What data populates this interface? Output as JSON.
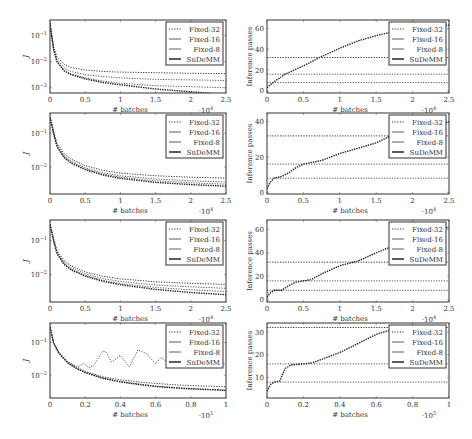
{
  "figure": {
    "legend_labels": [
      "Fixed-32",
      "Fixed-16",
      "Fixed-8",
      "SuDeMM"
    ],
    "colors": {
      "frame": "#333333",
      "series": "#444444",
      "text": "#333333"
    }
  },
  "chart_data": [
    {
      "id": "row1-left",
      "type": "line",
      "yscale": "log",
      "xlabel": "# batches",
      "ylabel": "J",
      "x_multiplier": "·10^4",
      "xlim": [
        0,
        2.5
      ],
      "ylim_log": [
        -3.2,
        -0.4
      ],
      "xticks": [
        0,
        0.5,
        1,
        1.5,
        2,
        2.5
      ],
      "xtick_labels": [
        "0",
        "0.5",
        "1",
        "1.5",
        "2",
        "2.5"
      ],
      "yticks_log": [
        -1,
        -2,
        -3
      ],
      "ytick_labels": [
        "10^-1",
        "10^-2",
        "10^-3"
      ],
      "legend": [
        "Fixed-32",
        "Fixed-16",
        "Fixed-8",
        "SuDeMM"
      ],
      "series": [
        {
          "name": "Fixed-32",
          "x": [
            0,
            0.05,
            0.1,
            0.2,
            0.3,
            0.5,
            0.75,
            1,
            1.5,
            2,
            2.5
          ],
          "y": [
            0.3,
            0.04,
            0.015,
            0.008,
            0.006,
            0.0048,
            0.0042,
            0.004,
            0.0038,
            0.0036,
            0.0035
          ]
        },
        {
          "name": "Fixed-16",
          "x": [
            0,
            0.05,
            0.1,
            0.2,
            0.3,
            0.5,
            0.75,
            1,
            1.5,
            2,
            2.5
          ],
          "y": [
            0.3,
            0.035,
            0.012,
            0.006,
            0.0042,
            0.0032,
            0.0027,
            0.0024,
            0.0021,
            0.002,
            0.0019
          ]
        },
        {
          "name": "Fixed-8",
          "x": [
            0,
            0.05,
            0.1,
            0.2,
            0.3,
            0.5,
            0.75,
            1,
            1.5,
            2,
            2.5
          ],
          "y": [
            0.3,
            0.03,
            0.01,
            0.0048,
            0.0034,
            0.0024,
            0.0018,
            0.0015,
            0.0012,
            0.0011,
            0.001
          ]
        },
        {
          "name": "SuDeMM",
          "x": [
            0,
            0.05,
            0.1,
            0.2,
            0.3,
            0.5,
            0.75,
            1,
            1.5,
            2,
            2.5
          ],
          "y": [
            0.3,
            0.03,
            0.01,
            0.0045,
            0.0032,
            0.0022,
            0.0016,
            0.0013,
            0.0009,
            0.0007,
            0.00055
          ]
        }
      ]
    },
    {
      "id": "row1-right",
      "type": "line",
      "yscale": "linear",
      "xlabel": "# batches",
      "ylabel": "Inference passes",
      "x_multiplier": "·10^4",
      "xlim": [
        0,
        2.5
      ],
      "ylim": [
        -2,
        68
      ],
      "xticks": [
        0,
        0.5,
        1,
        1.5,
        2,
        2.5
      ],
      "xtick_labels": [
        "0",
        "0.5",
        "1",
        "1.5",
        "2",
        "2.5"
      ],
      "yticks": [
        0,
        20,
        40,
        60
      ],
      "ytick_labels": [
        "0",
        "20",
        "40",
        "60"
      ],
      "legend": [
        "Fixed-32",
        "Fixed-16",
        "Fixed-8",
        "SuDeMM"
      ],
      "series": [
        {
          "name": "Fixed-32",
          "x": [
            0,
            2.5
          ],
          "y": [
            32,
            32
          ]
        },
        {
          "name": "Fixed-16",
          "x": [
            0,
            2.5
          ],
          "y": [
            16,
            16
          ]
        },
        {
          "name": "Fixed-8",
          "x": [
            0,
            2.5
          ],
          "y": [
            8,
            8
          ]
        },
        {
          "name": "SuDeMM",
          "x": [
            0,
            0.1,
            0.25,
            0.5,
            0.75,
            1,
            1.25,
            1.5,
            1.75,
            2.0,
            2.5
          ],
          "y": [
            3,
            9,
            16,
            24,
            33,
            41,
            48,
            53,
            57,
            60,
            63
          ]
        }
      ]
    },
    {
      "id": "row2-left",
      "type": "line",
      "yscale": "log",
      "xlabel": "# batches",
      "ylabel": "J",
      "x_multiplier": "·10^4",
      "xlim": [
        0,
        2.5
      ],
      "ylim_log": [
        -2.8,
        -0.4
      ],
      "xticks": [
        0,
        0.5,
        1,
        1.5,
        2,
        2.5
      ],
      "xtick_labels": [
        "0",
        "0.5",
        "1",
        "1.5",
        "2",
        "2.5"
      ],
      "yticks_log": [
        -1,
        -2
      ],
      "ytick_labels": [
        "10^-1",
        "10^-2"
      ],
      "legend": [
        "Fixed-32",
        "Fixed-16",
        "Fixed-8",
        "SuDeMM"
      ],
      "series": [
        {
          "name": "Fixed-32",
          "x": [
            0,
            0.05,
            0.1,
            0.2,
            0.3,
            0.5,
            0.75,
            1,
            1.5,
            2,
            2.5
          ],
          "y": [
            0.3,
            0.12,
            0.05,
            0.025,
            0.017,
            0.011,
            0.008,
            0.0066,
            0.0055,
            0.005,
            0.0047
          ]
        },
        {
          "name": "Fixed-16",
          "x": [
            0,
            0.05,
            0.1,
            0.2,
            0.3,
            0.5,
            0.75,
            1,
            1.5,
            2,
            2.5
          ],
          "y": [
            0.3,
            0.11,
            0.045,
            0.022,
            0.015,
            0.0095,
            0.0068,
            0.0055,
            0.0044,
            0.0039,
            0.0036
          ]
        },
        {
          "name": "Fixed-8",
          "x": [
            0,
            0.05,
            0.1,
            0.2,
            0.3,
            0.5,
            0.75,
            1,
            1.5,
            2,
            2.5
          ],
          "y": [
            0.3,
            0.1,
            0.042,
            0.02,
            0.014,
            0.0088,
            0.0062,
            0.005,
            0.0039,
            0.0034,
            0.0031
          ]
        },
        {
          "name": "SuDeMM",
          "x": [
            0,
            0.05,
            0.1,
            0.2,
            0.3,
            0.5,
            0.75,
            1,
            1.5,
            2,
            2.5
          ],
          "y": [
            0.3,
            0.1,
            0.04,
            0.019,
            0.013,
            0.0083,
            0.0058,
            0.0046,
            0.0035,
            0.003,
            0.0027
          ]
        }
      ]
    },
    {
      "id": "row2-right",
      "type": "line",
      "yscale": "linear",
      "xlabel": "# batches",
      "ylabel": "Inference passes",
      "x_multiplier": "·10^4",
      "xlim": [
        0,
        2.5
      ],
      "ylim": [
        -1,
        45
      ],
      "xticks": [
        0,
        0.5,
        1,
        1.5,
        2,
        2.5
      ],
      "xtick_labels": [
        "0",
        "0.5",
        "1",
        "1.5",
        "2",
        "2.5"
      ],
      "yticks": [
        0,
        20,
        40
      ],
      "ytick_labels": [
        "0",
        "20",
        "40"
      ],
      "legend": [
        "Fixed-32",
        "Fixed-16",
        "Fixed-8",
        "SuDeMM"
      ],
      "series": [
        {
          "name": "Fixed-32",
          "x": [
            0,
            2.5
          ],
          "y": [
            32,
            32
          ]
        },
        {
          "name": "Fixed-16",
          "x": [
            0,
            2.5
          ],
          "y": [
            16,
            16
          ]
        },
        {
          "name": "Fixed-8",
          "x": [
            0,
            2.5
          ],
          "y": [
            8,
            8
          ]
        },
        {
          "name": "SuDeMM",
          "x": [
            0,
            0.05,
            0.1,
            0.2,
            0.3,
            0.4,
            0.5,
            0.75,
            1,
            1.25,
            1.5,
            1.7,
            2.0,
            2.3,
            2.5
          ],
          "y": [
            2,
            6,
            8,
            9,
            11,
            14,
            16,
            18,
            22,
            25,
            28,
            32,
            35,
            38,
            40
          ]
        }
      ]
    },
    {
      "id": "row3-left",
      "type": "line",
      "yscale": "log",
      "xlabel": "# batches",
      "ylabel": "J",
      "x_multiplier": "·10^4",
      "xlim": [
        0,
        2.5
      ],
      "ylim_log": [
        -2.8,
        -0.4
      ],
      "xticks": [
        0,
        0.5,
        1,
        1.5,
        2,
        2.5
      ],
      "xtick_labels": [
        "0",
        "0.5",
        "1",
        "1.5",
        "2",
        "2.5"
      ],
      "yticks_log": [
        -1,
        -2
      ],
      "ytick_labels": [
        "10^-1",
        "10^-2"
      ],
      "legend": [
        "Fixed-32",
        "Fixed-16",
        "Fixed-8",
        "SuDeMM"
      ],
      "series": [
        {
          "name": "Fixed-32",
          "x": [
            0,
            0.05,
            0.1,
            0.2,
            0.3,
            0.5,
            0.75,
            1,
            1.5,
            2,
            2.5
          ],
          "y": [
            0.3,
            0.12,
            0.05,
            0.026,
            0.018,
            0.012,
            0.009,
            0.0075,
            0.0062,
            0.0056,
            0.0052
          ]
        },
        {
          "name": "Fixed-16",
          "x": [
            0,
            0.05,
            0.1,
            0.2,
            0.3,
            0.5,
            0.75,
            1,
            1.5,
            2,
            2.5
          ],
          "y": [
            0.3,
            0.11,
            0.046,
            0.023,
            0.016,
            0.0105,
            0.0077,
            0.0063,
            0.005,
            0.0044,
            0.004
          ]
        },
        {
          "name": "Fixed-8",
          "x": [
            0,
            0.05,
            0.1,
            0.2,
            0.3,
            0.5,
            0.75,
            1,
            1.5,
            2,
            2.5
          ],
          "y": [
            0.3,
            0.1,
            0.043,
            0.021,
            0.0145,
            0.0095,
            0.0068,
            0.0055,
            0.0042,
            0.0036,
            0.0032
          ]
        },
        {
          "name": "SuDeMM",
          "x": [
            0,
            0.05,
            0.1,
            0.2,
            0.3,
            0.5,
            0.75,
            1,
            1.5,
            2,
            2.5
          ],
          "y": [
            0.3,
            0.1,
            0.041,
            0.02,
            0.0138,
            0.009,
            0.0064,
            0.0051,
            0.0037,
            0.003,
            0.0026
          ]
        }
      ]
    },
    {
      "id": "row3-right",
      "type": "line",
      "yscale": "linear",
      "xlabel": "# batches",
      "ylabel": "Inference passes",
      "x_multiplier": "·10^4",
      "xlim": [
        0,
        2.5
      ],
      "ylim": [
        -2,
        68
      ],
      "xticks": [
        0,
        0.5,
        1,
        1.5,
        2,
        2.5
      ],
      "xtick_labels": [
        "0",
        "0.5",
        "1",
        "1.5",
        "2",
        "2.5"
      ],
      "yticks": [
        0,
        20,
        40,
        60
      ],
      "ytick_labels": [
        "0",
        "20",
        "40",
        "60"
      ],
      "legend": [
        "Fixed-32",
        "Fixed-16",
        "Fixed-8",
        "SuDeMM"
      ],
      "series": [
        {
          "name": "Fixed-32",
          "x": [
            0,
            2.5
          ],
          "y": [
            32,
            32
          ]
        },
        {
          "name": "Fixed-16",
          "x": [
            0,
            2.5
          ],
          "y": [
            16,
            16
          ]
        },
        {
          "name": "Fixed-8",
          "x": [
            0,
            2.5
          ],
          "y": [
            8,
            8
          ]
        },
        {
          "name": "SuDeMM",
          "x": [
            0,
            0.05,
            0.1,
            0.2,
            0.3,
            0.4,
            0.6,
            0.75,
            1,
            1.25,
            1.5,
            1.7,
            2.0,
            2.3,
            2.5
          ],
          "y": [
            2,
            6,
            8,
            8,
            12,
            15,
            17,
            22,
            29,
            33,
            40,
            45,
            52,
            58,
            62
          ]
        }
      ]
    },
    {
      "id": "row4-left",
      "type": "line",
      "yscale": "log",
      "xlabel": "# batches",
      "ylabel": "J",
      "x_multiplier": "·10^5",
      "xlim": [
        0,
        1
      ],
      "ylim_log": [
        -2.7,
        -0.4
      ],
      "xticks": [
        0,
        0.2,
        0.4,
        0.6,
        0.8,
        1
      ],
      "xtick_labels": [
        "0",
        "0.2",
        "0.4",
        "0.6",
        "0.8",
        "1"
      ],
      "yticks_log": [
        -1,
        -2
      ],
      "ytick_labels": [
        "10^-1",
        "10^-2"
      ],
      "legend": [
        "Fixed-32",
        "Fixed-16",
        "Fixed-8",
        "SuDeMM"
      ],
      "series": [
        {
          "name": "Fixed-32",
          "x": [
            0,
            0.02,
            0.05,
            0.1,
            0.15,
            0.2,
            0.3,
            0.4,
            0.5,
            0.6,
            0.7,
            0.8,
            0.9,
            1
          ],
          "y": [
            0.3,
            0.1,
            0.05,
            0.026,
            0.018,
            0.013,
            0.009,
            0.0072,
            0.0062,
            0.0056,
            0.0051,
            0.0048,
            0.0046,
            0.0044
          ]
        },
        {
          "name": "Fixed-16",
          "x": [
            0,
            0.02,
            0.05,
            0.1,
            0.15,
            0.17,
            0.19,
            0.22,
            0.25,
            0.3,
            0.32,
            0.35,
            0.4,
            0.45,
            0.5,
            0.55,
            0.6,
            0.63,
            0.66,
            0.7,
            0.75,
            0.8,
            0.85,
            0.9,
            1
          ],
          "y": [
            0.3,
            0.1,
            0.05,
            0.026,
            0.018,
            0.019,
            0.023,
            0.017,
            0.02,
            0.055,
            0.05,
            0.025,
            0.04,
            0.018,
            0.06,
            0.045,
            0.022,
            0.035,
            0.026,
            0.045,
            0.022,
            0.03,
            0.024,
            0.025,
            0.022
          ]
        },
        {
          "name": "Fixed-8",
          "x": [
            0,
            0.02,
            0.05,
            0.1,
            0.15,
            0.2,
            0.3,
            0.4,
            0.5,
            0.6,
            0.7,
            0.8,
            0.9,
            1
          ],
          "y": [
            0.3,
            0.1,
            0.048,
            0.024,
            0.016,
            0.012,
            0.0082,
            0.0064,
            0.0054,
            0.0047,
            0.0042,
            0.0039,
            0.0037,
            0.0035
          ]
        },
        {
          "name": "SuDeMM",
          "x": [
            0,
            0.02,
            0.05,
            0.1,
            0.15,
            0.2,
            0.3,
            0.4,
            0.5,
            0.6,
            0.7,
            0.8,
            0.9,
            1
          ],
          "y": [
            0.3,
            0.1,
            0.048,
            0.024,
            0.016,
            0.012,
            0.008,
            0.0062,
            0.0052,
            0.0045,
            0.0041,
            0.0038,
            0.0036,
            0.0034
          ]
        }
      ]
    },
    {
      "id": "row4-right",
      "type": "line",
      "yscale": "linear",
      "xlabel": "# batches",
      "ylabel": "Inference passes",
      "x_multiplier": "·10^5",
      "xlim": [
        0,
        1
      ],
      "ylim": [
        1,
        34
      ],
      "xticks": [
        0,
        0.2,
        0.4,
        0.6,
        0.8,
        1
      ],
      "xtick_labels": [
        "0",
        "0.2",
        "0.4",
        "0.6",
        "0.8",
        "1"
      ],
      "yticks": [
        10,
        20,
        30
      ],
      "ytick_labels": [
        "10",
        "20",
        "30"
      ],
      "legend": [
        "Fixed-32",
        "Fixed-16",
        "Fixed-8",
        "SuDeMM"
      ],
      "series": [
        {
          "name": "Fixed-32",
          "x": [
            0,
            1
          ],
          "y": [
            32,
            32
          ]
        },
        {
          "name": "Fixed-16",
          "x": [
            0,
            1
          ],
          "y": [
            16,
            16
          ]
        },
        {
          "name": "Fixed-8",
          "x": [
            0,
            1
          ],
          "y": [
            8,
            8
          ]
        },
        {
          "name": "SuDeMM",
          "x": [
            0,
            0.02,
            0.04,
            0.07,
            0.1,
            0.13,
            0.2,
            0.25,
            0.3,
            0.4,
            0.5,
            0.6,
            0.66,
            0.7
          ],
          "y": [
            4,
            7,
            8,
            8.5,
            14,
            15.5,
            16,
            16.5,
            18,
            21,
            25,
            29,
            30.5,
            31
          ]
        }
      ]
    }
  ]
}
